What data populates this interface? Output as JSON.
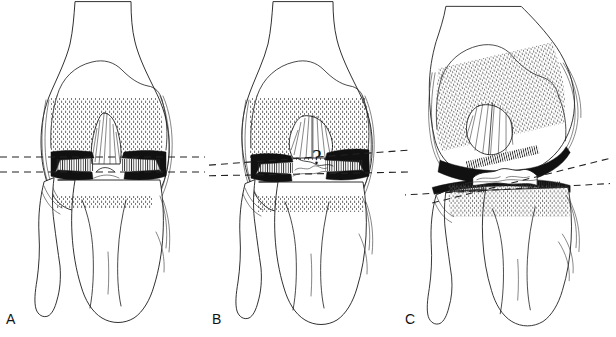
{
  "figure": {
    "type": "medical-line-illustration",
    "background_color": "#ffffff",
    "ink_color": "#111111",
    "panel_count": 3
  },
  "panels": [
    {
      "label": "A",
      "caption_letter": "A",
      "description": "normal knee with preserved symmetric joint space, two parallel horizontal dashed reference lines",
      "reference_lines": {
        "count": 2,
        "style": "dashed",
        "orientation": "parallel horizontal",
        "upper_line_y": 157,
        "lower_line_y": 172,
        "angle_degrees": 0
      },
      "annotation_symbol": ""
    },
    {
      "label": "B",
      "caption_letter": "B",
      "description": "knee with medial joint space narrowing, slightly converging dashed reference lines and a question mark over the intercondylar region",
      "reference_lines": {
        "count": 2,
        "style": "dashed",
        "orientation": "slightly convergent",
        "upper_line_y": 160,
        "lower_line_y": 172,
        "angle_degrees": 3
      },
      "annotation_symbol": "?"
    },
    {
      "label": "C",
      "caption_letter": "C",
      "description": "knee with marked varus angular deformity and joint space collapse, two crossing dashed reference lines",
      "reference_lines": {
        "count": 2,
        "style": "dashed",
        "orientation": "crossing",
        "upper_line_angle_degrees": -14,
        "lower_line_angle_degrees": 3,
        "crossing_point_x": 440,
        "crossing_point_y": 178
      },
      "annotation_symbol": ""
    }
  ],
  "colors": {
    "background": "#ffffff",
    "line": "#1a1a1a",
    "stipple": "#555555",
    "dark_cartilage": "#111111",
    "dashed_reference": "#222222"
  }
}
